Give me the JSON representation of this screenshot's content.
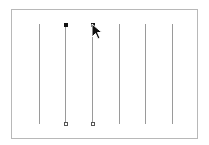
{
  "canvas": {
    "border_color": "#b8b8b8",
    "line_color": "#9a9a9a",
    "lines": [
      {
        "x": 39,
        "y1": 24,
        "y2": 124,
        "selected": false
      },
      {
        "x": 65,
        "y1": 24,
        "y2": 124,
        "selected": true
      },
      {
        "x": 92,
        "y1": 24,
        "y2": 124,
        "selected": true
      },
      {
        "x": 119,
        "y1": 24,
        "y2": 124,
        "selected": false
      },
      {
        "x": 145,
        "y1": 24,
        "y2": 124,
        "selected": false
      },
      {
        "x": 172,
        "y1": 24,
        "y2": 124,
        "selected": false
      }
    ],
    "cursor": {
      "type": "arrow-pointer",
      "x": 92,
      "y": 25
    }
  }
}
